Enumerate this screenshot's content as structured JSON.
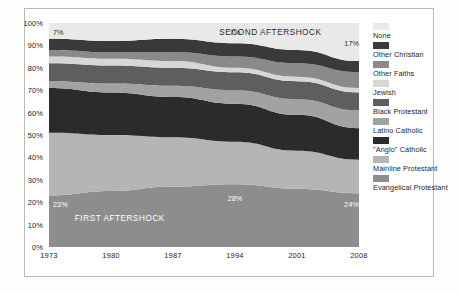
{
  "chart_data": {
    "type": "area",
    "title": "",
    "subtitle": "",
    "xlabel": "",
    "ylabel": "",
    "stacked": true,
    "percent_stacked": true,
    "grid": true,
    "legend_position": "right",
    "xlim": [
      1973,
      2008
    ],
    "ylim": [
      0,
      100
    ],
    "x": [
      1973,
      1980,
      1987,
      1994,
      2001,
      2008
    ],
    "xticklabels": [
      "1973",
      "1980",
      "1987",
      "1994",
      "2001",
      "2008"
    ],
    "yticklabels": [
      "0%",
      "10%",
      "20%",
      "30%",
      "40%",
      "50%",
      "60%",
      "70%",
      "80%",
      "90%",
      "100%"
    ],
    "ytickvalues": [
      0,
      10,
      20,
      30,
      40,
      50,
      60,
      70,
      80,
      90,
      100
    ],
    "stack_order_bottom_to_top": [
      "Evangelical Protestant",
      "Mainline Protestant",
      "\"Anglo\" Catholic",
      "Latino Catholic",
      "Black Protestant",
      "Jewish",
      "Other Faiths",
      "Other Christian",
      "None"
    ],
    "series": [
      {
        "name": "Evangelical Protestant",
        "color": "#8d8d8d",
        "values": [
          23,
          25,
          27,
          28,
          26,
          24
        ]
      },
      {
        "name": "Mainline Protestant",
        "color": "#b5b5b5",
        "values": [
          28,
          25,
          22,
          19,
          17,
          15
        ]
      },
      {
        "name": "\"Anglo\" Catholic",
        "color": "#2b2b2b",
        "values": [
          20,
          19,
          18,
          17,
          16,
          14
        ]
      },
      {
        "name": "Latino Catholic",
        "color": "#a2a2a2",
        "values": [
          3,
          4,
          5,
          6,
          7,
          8
        ]
      },
      {
        "name": "Black Protestant",
        "color": "#5e5e5e",
        "values": [
          8,
          8,
          8,
          8,
          8,
          8
        ]
      },
      {
        "name": "Jewish",
        "color": "#d7d7d7",
        "values": [
          3,
          3,
          3,
          2,
          2,
          2
        ]
      },
      {
        "name": "Other Faiths",
        "color": "#8a8a8a",
        "values": [
          3,
          3,
          4,
          5,
          6,
          7
        ]
      },
      {
        "name": "Other Christian",
        "color": "#3a3a3a",
        "values": [
          5,
          5,
          6,
          6,
          6,
          5
        ]
      },
      {
        "name": "None",
        "color": "#e9e9e9",
        "values": [
          7,
          8,
          7,
          9,
          12,
          17
        ]
      }
    ],
    "annotations": [
      {
        "id": "second-aftershock",
        "text": "SECOND AFTERSHOCK",
        "x": 1998,
        "y": 96
      },
      {
        "id": "first-aftershock",
        "text": "FIRST AFTERSHOCK",
        "x": 1981,
        "y": 13
      }
    ],
    "data_labels": [
      {
        "id": "none-1973",
        "text": "7%",
        "series": "None",
        "x": 1973,
        "y": 96
      },
      {
        "id": "none-1994",
        "text": "7%",
        "series": "None",
        "x": 1994,
        "y": 96
      },
      {
        "id": "none-2008",
        "text": "17%",
        "series": "None",
        "x": 2008,
        "y": 91
      },
      {
        "id": "evangelical-1973",
        "text": "23%",
        "series": "Evangelical Protestant",
        "x": 1973,
        "y": 19
      },
      {
        "id": "evangelical-1994",
        "text": "28%",
        "series": "Evangelical Protestant",
        "x": 1994,
        "y": 22
      },
      {
        "id": "evangelical-2008",
        "text": "24%",
        "series": "Evangelical Protestant",
        "x": 2008,
        "y": 19
      }
    ]
  },
  "legend": {
    "items": [
      {
        "label": "None",
        "color": "#e9e9e9"
      },
      {
        "label": "Other Christian",
        "color": "#3a3a3a"
      },
      {
        "label": "Other Faiths",
        "color": "#8a8a8a"
      },
      {
        "label": "Jewish",
        "color": "#d7d7d7"
      },
      {
        "label": "Black Protestant",
        "color": "#5e5e5e"
      },
      {
        "label": "Latino Catholic",
        "color": "#a2a2a2"
      },
      {
        "label": "\"Anglo\" Catholic",
        "color": "#2b2b2b"
      },
      {
        "label": "Mainline Protestant",
        "color": "#b5b5b5"
      },
      {
        "label": "Evangelical Protestant",
        "color": "#8d8d8d"
      }
    ]
  }
}
